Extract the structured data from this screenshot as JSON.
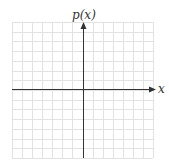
{
  "diagram": {
    "type": "coordinate-grid",
    "y_axis_label": "p(x)",
    "x_axis_label": "x",
    "grid": {
      "columns": 14,
      "rows": 14,
      "line_color": "#e2e2e2",
      "axis_color": "#333333"
    }
  }
}
